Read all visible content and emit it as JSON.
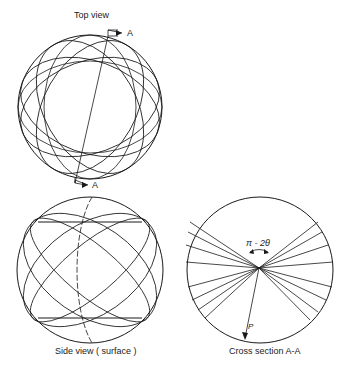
{
  "figure": {
    "top_view": {
      "title": "Top view",
      "section_label_top": "A",
      "section_label_bottom": "A"
    },
    "side_view": {
      "caption": "Side view ( surface )"
    },
    "cross_section": {
      "caption": "Cross section A-A",
      "angle_label": "π - 2θ",
      "vector_label": "P"
    }
  },
  "colors": {
    "line": "#1a1a1a",
    "background": "#ffffff"
  }
}
